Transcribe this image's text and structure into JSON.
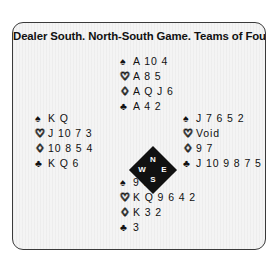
{
  "card": {
    "title": "Dealer South. North-South Game. Teams of Four",
    "background_color": "#f4f4f4",
    "border_color": "#3a3a3a",
    "text_color": "#111111"
  },
  "suit_symbols": {
    "spade": "♠",
    "heart": "♡",
    "diamond": "♢",
    "club": "♣"
  },
  "compass": {
    "north": "N",
    "east": "E",
    "south": "S",
    "west": "W",
    "fill_color": "#111111",
    "label_color": "#ffffff"
  },
  "hands": {
    "north": {
      "seat": "North",
      "spades": "A 10 4",
      "hearts": "A 8 5",
      "diamonds": "A Q J 6",
      "clubs": "A 4 2"
    },
    "west": {
      "seat": "West",
      "spades": "K Q",
      "hearts": "J 10 7 3",
      "diamonds": "10 8 5 4",
      "clubs": "K Q 6"
    },
    "east": {
      "seat": "East",
      "spades": "J 7 6 5 2",
      "hearts": "Void",
      "diamonds": "9 7",
      "clubs": "J 10 9 8 7 5"
    },
    "south": {
      "seat": "South",
      "spades": "9 8 3",
      "hearts": "K Q 9 6 4 2",
      "diamonds": "K 3 2",
      "clubs": "3"
    }
  }
}
